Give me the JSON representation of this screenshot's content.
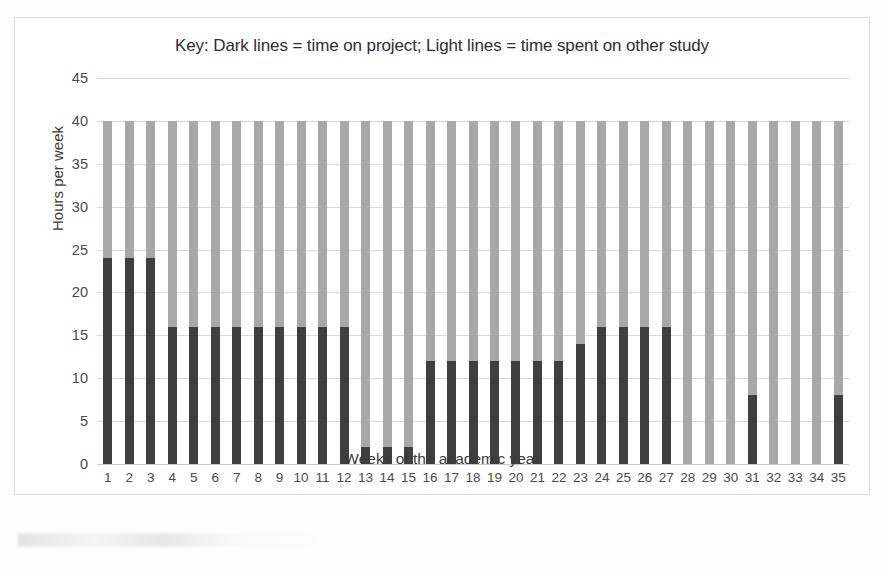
{
  "chart_data": {
    "type": "bar",
    "title": "Key: Dark lines = time on project; Light lines = time spent on other study",
    "xlabel": "Weeks of the academic year",
    "ylabel": "Hours per week",
    "ylim": [
      0,
      45
    ],
    "ytick_step": 5,
    "yticks": [
      0,
      5,
      10,
      15,
      20,
      25,
      30,
      35,
      40,
      45
    ],
    "grid": true,
    "legend_position": "none",
    "stacked": true,
    "total_per_week": 40,
    "categories": [
      1,
      2,
      3,
      4,
      5,
      6,
      7,
      8,
      9,
      10,
      11,
      12,
      13,
      14,
      15,
      16,
      17,
      18,
      19,
      20,
      21,
      22,
      23,
      24,
      25,
      26,
      27,
      28,
      29,
      30,
      31,
      32,
      33,
      34,
      35
    ],
    "series": [
      {
        "name": "time on project",
        "color": "#3f3f3f",
        "values": [
          24,
          24,
          24,
          16,
          16,
          16,
          16,
          16,
          16,
          16,
          16,
          16,
          2,
          2,
          2,
          12,
          12,
          12,
          12,
          12,
          12,
          12,
          14,
          16,
          16,
          16,
          16,
          0,
          0,
          0,
          8,
          0,
          0,
          0,
          8
        ]
      },
      {
        "name": "time spent on other study",
        "color": "#a8a8a8",
        "values": [
          16,
          16,
          16,
          24,
          24,
          24,
          24,
          24,
          24,
          24,
          24,
          24,
          38,
          38,
          38,
          28,
          28,
          28,
          28,
          28,
          28,
          28,
          26,
          24,
          24,
          24,
          24,
          40,
          40,
          40,
          32,
          40,
          40,
          40,
          32
        ]
      }
    ]
  }
}
